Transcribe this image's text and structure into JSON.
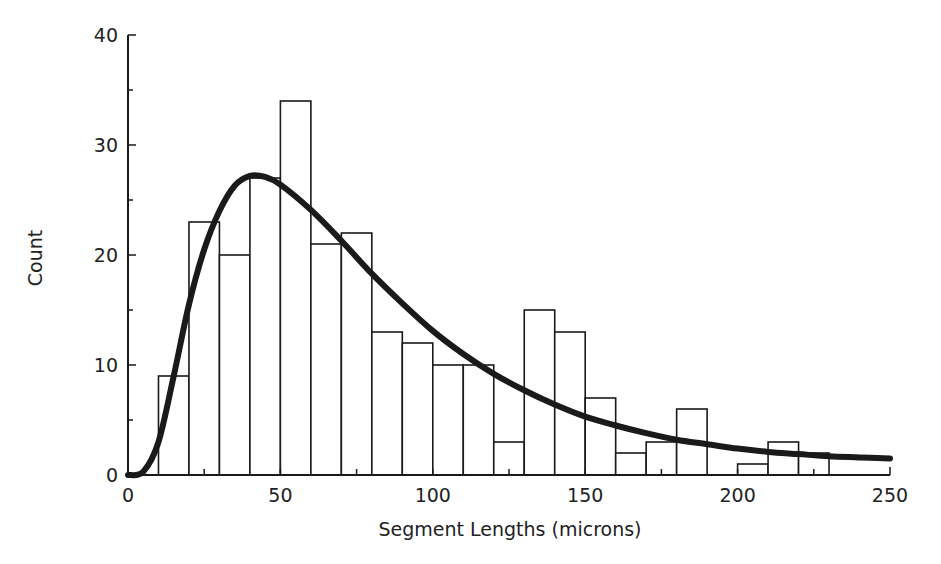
{
  "chart_data": {
    "type": "bar",
    "title": "",
    "xlabel": "Segment Lengths (microns)",
    "ylabel": "Count",
    "xlim": [
      0,
      250
    ],
    "ylim": [
      0,
      40
    ],
    "xticks": [
      0,
      50,
      100,
      150,
      200,
      250
    ],
    "yticks": [
      0,
      10,
      20,
      30,
      40
    ],
    "grid": false,
    "legend": null,
    "bin_width": 10,
    "bins": [
      {
        "start": 10,
        "end": 20,
        "count": 9
      },
      {
        "start": 20,
        "end": 30,
        "count": 23
      },
      {
        "start": 30,
        "end": 40,
        "count": 20
      },
      {
        "start": 40,
        "end": 50,
        "count": 27
      },
      {
        "start": 50,
        "end": 60,
        "count": 34
      },
      {
        "start": 60,
        "end": 70,
        "count": 21
      },
      {
        "start": 70,
        "end": 80,
        "count": 22
      },
      {
        "start": 80,
        "end": 90,
        "count": 13
      },
      {
        "start": 90,
        "end": 100,
        "count": 12
      },
      {
        "start": 100,
        "end": 110,
        "count": 10
      },
      {
        "start": 110,
        "end": 120,
        "count": 10
      },
      {
        "start": 120,
        "end": 130,
        "count": 3
      },
      {
        "start": 130,
        "end": 140,
        "count": 15
      },
      {
        "start": 140,
        "end": 150,
        "count": 13
      },
      {
        "start": 150,
        "end": 160,
        "count": 7
      },
      {
        "start": 160,
        "end": 170,
        "count": 2
      },
      {
        "start": 170,
        "end": 180,
        "count": 3
      },
      {
        "start": 180,
        "end": 190,
        "count": 6
      },
      {
        "start": 190,
        "end": 200,
        "count": 0
      },
      {
        "start": 200,
        "end": 210,
        "count": 1
      },
      {
        "start": 210,
        "end": 220,
        "count": 3
      },
      {
        "start": 220,
        "end": 230,
        "count": 2
      }
    ],
    "series": [
      {
        "name": "fitted distribution curve",
        "type": "line",
        "x": [
          0,
          5,
          10,
          15,
          20,
          25,
          30,
          35,
          40,
          45,
          50,
          60,
          70,
          80,
          90,
          100,
          110,
          120,
          130,
          140,
          150,
          160,
          170,
          180,
          190,
          200,
          210,
          220,
          230,
          240,
          250
        ],
        "y": [
          0,
          0.3,
          3,
          9,
          15.5,
          20.5,
          24,
          26.3,
          27.2,
          27.1,
          26.4,
          24.1,
          21.3,
          18.3,
          15.6,
          13.1,
          11.0,
          9.2,
          7.7,
          6.4,
          5.3,
          4.5,
          3.8,
          3.2,
          2.8,
          2.4,
          2.1,
          1.9,
          1.7,
          1.6,
          1.5
        ]
      }
    ]
  }
}
